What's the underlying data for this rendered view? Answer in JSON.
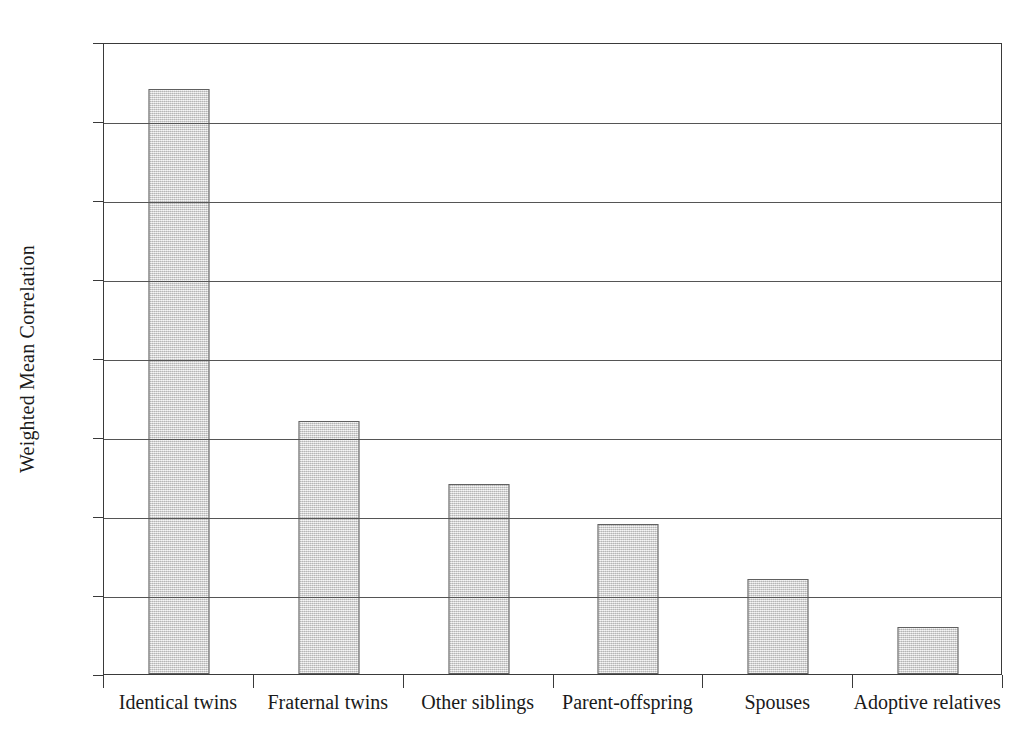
{
  "chart_data": {
    "type": "bar",
    "title": "",
    "subtitle": "",
    "xlabel": "",
    "ylabel": "Weighted Mean Correlation",
    "categories": [
      "Identical twins",
      "Fraternal twins",
      "Other siblings",
      "Parent-offspring",
      "Spouses",
      "Adoptive relatives"
    ],
    "values": [
      0.74,
      0.32,
      0.24,
      0.19,
      0.12,
      0.06
    ],
    "ylim": [
      0,
      0.8
    ],
    "ytick_labels": [
      "0",
      "0.1",
      "0.2",
      "0.3",
      "0.4",
      "0.5",
      "0.6",
      "0.7",
      "0.8"
    ],
    "ytick_values": [
      0,
      0.1,
      0.2,
      0.3,
      0.4,
      0.5,
      0.6,
      0.7,
      0.8
    ],
    "grid": "horizontal",
    "legend": "none",
    "bar_fill_color": "#d6d6d6",
    "bar_edge_color": "#606060",
    "axis_color": "#3a3a3a",
    "gridline_color": "#555555",
    "background_color": "#ffffff",
    "text_color": "#1a1a1a"
  }
}
